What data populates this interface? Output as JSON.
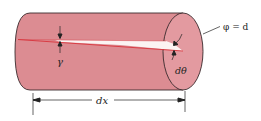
{
  "figure": {
    "colors": {
      "cylinder_fill": "#dc8c92",
      "cylinder_end_fill": "#e39aa0",
      "outline": "#3a2a2c",
      "strain_line": "#d8343c",
      "wedge_fill": "#fbf3f2",
      "annotation": "#222222"
    },
    "labels": {
      "shear_strain": "γ",
      "twist_angle": "dθ",
      "length": "dx",
      "end_face": "φ = d"
    },
    "annotations": {
      "shear_strain_arrows": "arrows-pointing-to-gap",
      "twist_angle_arrows": "curved-arrows-at-end-face",
      "length_dimension": "double-headed-dimension-line",
      "end_face_leader": "leader-line"
    }
  }
}
